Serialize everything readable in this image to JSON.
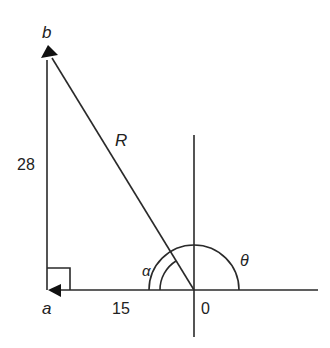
{
  "diagram": {
    "type": "vector-triangle",
    "colors": {
      "stroke": "#2a2a2a",
      "text": "#222222",
      "background": "#ffffff"
    },
    "points": {
      "a": {
        "label": "a",
        "x": 48,
        "y": 290
      },
      "b": {
        "label": "b",
        "x": 47,
        "y": 50
      },
      "origin": {
        "label": "0",
        "x": 194,
        "y": 290
      }
    },
    "labels": {
      "side_vertical": "28",
      "side_horizontal": "15",
      "hypotenuse": "R",
      "angle_alpha": "α",
      "angle_theta": "θ",
      "point_a": "a",
      "point_b": "b",
      "origin": "0"
    },
    "axes": {
      "horizontal": {
        "x1": 48,
        "x2": 318,
        "y": 290
      },
      "vertical": {
        "x": 194,
        "y1": 135,
        "y2": 337
      }
    }
  }
}
